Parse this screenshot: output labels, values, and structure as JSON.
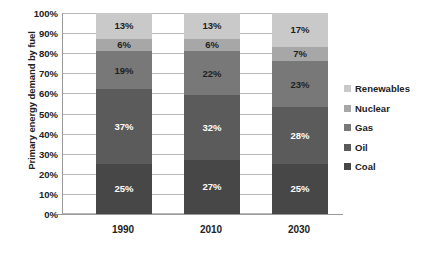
{
  "chart_data": {
    "type": "bar",
    "subtype": "stacked-percentage",
    "title": "",
    "xlabel": "",
    "ylabel": "Primary energy demand by fuel",
    "categories": [
      "1990",
      "2010",
      "2030"
    ],
    "ylim": [
      0,
      100
    ],
    "ytick_labels": [
      "100%",
      "90%",
      "80%",
      "70%",
      "60%",
      "50%",
      "40%",
      "30%",
      "20%",
      "10%",
      "0%"
    ],
    "ytick_values": [
      100,
      90,
      80,
      70,
      60,
      50,
      40,
      30,
      20,
      10,
      0
    ],
    "grid": true,
    "legend_position": "right",
    "series": [
      {
        "name": "Renewables",
        "color": "#c9c9c9",
        "values": [
          13,
          13,
          17
        ],
        "labels": [
          "13%",
          "13%",
          "17%"
        ]
      },
      {
        "name": "Nuclear",
        "color": "#a7a7a7",
        "values": [
          6,
          6,
          7
        ],
        "labels": [
          "6%",
          "6%",
          "7%"
        ]
      },
      {
        "name": "Gas",
        "color": "#787878",
        "values": [
          19,
          22,
          23
        ],
        "labels": [
          "19%",
          "22%",
          "23%"
        ]
      },
      {
        "name": "Oil",
        "color": "#5b5b5b",
        "values": [
          37,
          32,
          28
        ],
        "labels": [
          "37%",
          "32%",
          "28%"
        ]
      },
      {
        "name": "Coal",
        "color": "#474747",
        "values": [
          25,
          27,
          25
        ],
        "labels": [
          "25%",
          "27%",
          "25%"
        ]
      }
    ],
    "stack_order_top_to_bottom": [
      "Renewables",
      "Nuclear",
      "Gas",
      "Oil",
      "Coal"
    ]
  },
  "legend": {
    "items": [
      {
        "label": "Renewables"
      },
      {
        "label": "Nuclear"
      },
      {
        "label": "Gas"
      },
      {
        "label": "Oil"
      },
      {
        "label": "Coal"
      }
    ]
  }
}
